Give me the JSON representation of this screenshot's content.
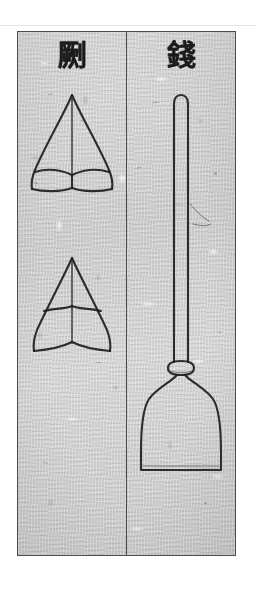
{
  "page": {
    "kind": "scanned-woodblock-plate",
    "background_color": "#ffffff",
    "paper_color": "#cfcfcf",
    "ink_color": "#1f1f1f",
    "border_color": "#4c4c4c"
  },
  "plate": {
    "columns": [
      {
        "id": "left",
        "heading": "劂",
        "heading_reading": "jue",
        "figures": [
          {
            "name": "arrowhead-upper",
            "caption": "",
            "description": "ogival two-barbed arrowhead, rounded leaf outline"
          },
          {
            "name": "arrowhead-lower",
            "caption": "",
            "description": "angular two-barbed arrowhead, straight-sided triangular outline"
          }
        ]
      },
      {
        "id": "right",
        "heading": "錢",
        "heading_reading": "qian",
        "figures": [
          {
            "name": "spade-tool",
            "caption": "",
            "description": "long slender shaft with rounded top, collar ferrule, broad flat-bottomed spade blade"
          }
        ]
      }
    ]
  },
  "icons": {
    "column_divider": "vertical-rule-icon",
    "plate_frame": "rectangle-frame-icon"
  }
}
